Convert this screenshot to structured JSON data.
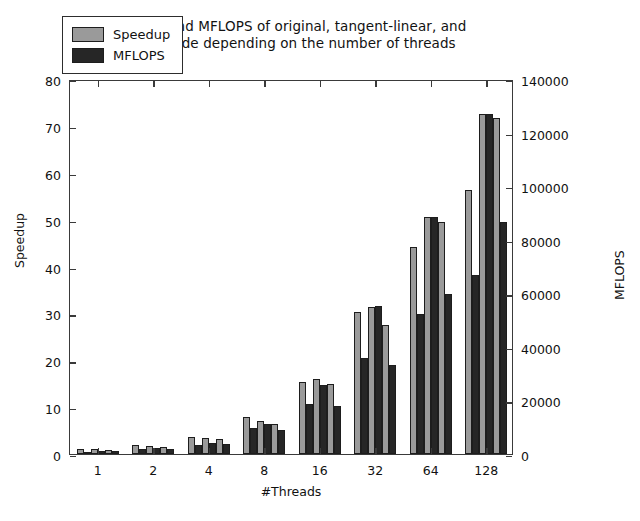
{
  "chart_data": {
    "type": "bar",
    "title": "Speedup and MFLOPS of original, tangent-linear, and adjoint code depending on the number of threads",
    "title_line1": "Speedup and MFLOPS of original, tangent-linear, and",
    "title_line2": "adjoint code depending on the number of threads",
    "xlabel": "#Threads",
    "ylabel": "Speedup",
    "y2label": "MFLOPS",
    "categories": [
      "1",
      "2",
      "4",
      "8",
      "16",
      "32",
      "64",
      "128"
    ],
    "ylim": [
      0,
      80
    ],
    "yticks": [
      0,
      10,
      20,
      30,
      40,
      50,
      60,
      70,
      80
    ],
    "y2lim": [
      0,
      140000
    ],
    "y2ticks": [
      0,
      20000,
      40000,
      60000,
      80000,
      100000,
      120000,
      140000
    ],
    "grid": false,
    "legend": [
      "Speedup",
      "MFLOPS"
    ],
    "legend_position": "upper left",
    "bars_per_group": 6,
    "variants": [
      "original",
      "tangent-linear",
      "adjoint"
    ],
    "series": [
      {
        "name": "Speedup",
        "axis": "left",
        "color": "#9a9a9a",
        "variant_values": {
          "original": [
            1.0,
            1.9,
            3.7,
            7.9,
            15.4,
            30.3,
            44.1,
            56.3
          ],
          "tangent-linear": [
            1.0,
            1.8,
            3.5,
            7.1,
            16.1,
            31.3,
            50.6,
            72.6
          ],
          "adjoint": [
            0.9,
            1.6,
            3.1,
            6.4,
            14.9,
            27.6,
            49.4,
            71.7
          ]
        }
      },
      {
        "name": "MFLOPS",
        "axis": "right",
        "color": "#262626",
        "variant_values": {
          "original": [
            900,
            1700,
            3400,
            9800,
            18500,
            35800,
            52200,
            66800
          ],
          "tangent-linear": [
            1100,
            2100,
            4200,
            11200,
            25600,
            55100,
            88500,
            127000
          ],
          "adjoint": [
            1000,
            1900,
            3900,
            8900,
            17900,
            33100,
            59700,
            86500
          ]
        }
      }
    ],
    "bar_sequence_note": "Within each thread group the bars alternate Speedup/MFLOPS for original, tangent-linear, adjoint.",
    "groups": [
      {
        "category": "1",
        "bars": [
          {
            "series": "Speedup",
            "variant": "original",
            "value": 1.0,
            "axis": "left"
          },
          {
            "series": "MFLOPS",
            "variant": "original",
            "value": 900,
            "axis": "right"
          },
          {
            "series": "Speedup",
            "variant": "tangent-linear",
            "value": 1.0,
            "axis": "left"
          },
          {
            "series": "MFLOPS",
            "variant": "tangent-linear",
            "value": 1100,
            "axis": "right"
          },
          {
            "series": "Speedup",
            "variant": "adjoint",
            "value": 0.9,
            "axis": "left"
          },
          {
            "series": "MFLOPS",
            "variant": "adjoint",
            "value": 1000,
            "axis": "right"
          }
        ]
      },
      {
        "category": "2",
        "bars": [
          {
            "series": "Speedup",
            "variant": "original",
            "value": 1.9,
            "axis": "left"
          },
          {
            "series": "MFLOPS",
            "variant": "original",
            "value": 1700,
            "axis": "right"
          },
          {
            "series": "Speedup",
            "variant": "tangent-linear",
            "value": 1.8,
            "axis": "left"
          },
          {
            "series": "MFLOPS",
            "variant": "tangent-linear",
            "value": 2100,
            "axis": "right"
          },
          {
            "series": "Speedup",
            "variant": "adjoint",
            "value": 1.6,
            "axis": "left"
          },
          {
            "series": "MFLOPS",
            "variant": "adjoint",
            "value": 1900,
            "axis": "right"
          }
        ]
      },
      {
        "category": "4",
        "bars": [
          {
            "series": "Speedup",
            "variant": "original",
            "value": 3.7,
            "axis": "left"
          },
          {
            "series": "MFLOPS",
            "variant": "original",
            "value": 3400,
            "axis": "right"
          },
          {
            "series": "Speedup",
            "variant": "tangent-linear",
            "value": 3.5,
            "axis": "left"
          },
          {
            "series": "MFLOPS",
            "variant": "tangent-linear",
            "value": 4200,
            "axis": "right"
          },
          {
            "series": "Speedup",
            "variant": "adjoint",
            "value": 3.1,
            "axis": "left"
          },
          {
            "series": "MFLOPS",
            "variant": "adjoint",
            "value": 3900,
            "axis": "right"
          }
        ]
      },
      {
        "category": "8",
        "bars": [
          {
            "series": "Speedup",
            "variant": "original",
            "value": 7.9,
            "axis": "left"
          },
          {
            "series": "MFLOPS",
            "variant": "original",
            "value": 9800,
            "axis": "right"
          },
          {
            "series": "Speedup",
            "variant": "tangent-linear",
            "value": 7.1,
            "axis": "left"
          },
          {
            "series": "MFLOPS",
            "variant": "tangent-linear",
            "value": 11200,
            "axis": "right"
          },
          {
            "series": "Speedup",
            "variant": "adjoint",
            "value": 6.4,
            "axis": "left"
          },
          {
            "series": "MFLOPS",
            "variant": "adjoint",
            "value": 8900,
            "axis": "right"
          }
        ]
      },
      {
        "category": "16",
        "bars": [
          {
            "series": "Speedup",
            "variant": "original",
            "value": 15.4,
            "axis": "left"
          },
          {
            "series": "MFLOPS",
            "variant": "original",
            "value": 18500,
            "axis": "right"
          },
          {
            "series": "Speedup",
            "variant": "tangent-linear",
            "value": 16.1,
            "axis": "left"
          },
          {
            "series": "MFLOPS",
            "variant": "tangent-linear",
            "value": 25600,
            "axis": "right"
          },
          {
            "series": "Speedup",
            "variant": "adjoint",
            "value": 14.9,
            "axis": "left"
          },
          {
            "series": "MFLOPS",
            "variant": "adjoint",
            "value": 17900,
            "axis": "right"
          }
        ]
      },
      {
        "category": "32",
        "bars": [
          {
            "series": "Speedup",
            "variant": "original",
            "value": 30.3,
            "axis": "left"
          },
          {
            "series": "MFLOPS",
            "variant": "original",
            "value": 35800,
            "axis": "right"
          },
          {
            "series": "Speedup",
            "variant": "tangent-linear",
            "value": 31.3,
            "axis": "left"
          },
          {
            "series": "MFLOPS",
            "variant": "tangent-linear",
            "value": 55100,
            "axis": "right"
          },
          {
            "series": "Speedup",
            "variant": "adjoint",
            "value": 27.6,
            "axis": "left"
          },
          {
            "series": "MFLOPS",
            "variant": "adjoint",
            "value": 33100,
            "axis": "right"
          }
        ]
      },
      {
        "category": "64",
        "bars": [
          {
            "series": "Speedup",
            "variant": "original",
            "value": 44.1,
            "axis": "left"
          },
          {
            "series": "MFLOPS",
            "variant": "original",
            "value": 52200,
            "axis": "right"
          },
          {
            "series": "Speedup",
            "variant": "tangent-linear",
            "value": 50.6,
            "axis": "left"
          },
          {
            "series": "MFLOPS",
            "variant": "tangent-linear",
            "value": 88500,
            "axis": "right"
          },
          {
            "series": "Speedup",
            "variant": "adjoint",
            "value": 49.4,
            "axis": "left"
          },
          {
            "series": "MFLOPS",
            "variant": "adjoint",
            "value": 59700,
            "axis": "right"
          }
        ]
      },
      {
        "category": "128",
        "bars": [
          {
            "series": "Speedup",
            "variant": "original",
            "value": 56.3,
            "axis": "left"
          },
          {
            "series": "MFLOPS",
            "variant": "original",
            "value": 66800,
            "axis": "right"
          },
          {
            "series": "Speedup",
            "variant": "tangent-linear",
            "value": 72.6,
            "axis": "left"
          },
          {
            "series": "MFLOPS",
            "variant": "tangent-linear",
            "value": 127000,
            "axis": "right"
          },
          {
            "series": "Speedup",
            "variant": "adjoint",
            "value": 71.7,
            "axis": "left"
          },
          {
            "series": "MFLOPS",
            "variant": "adjoint",
            "value": 86500,
            "axis": "right"
          }
        ]
      }
    ]
  },
  "colors": {
    "speedup": "#9a9a9a",
    "mflops": "#262626",
    "axis": "#3a3a3a",
    "background": "#ffffff"
  }
}
